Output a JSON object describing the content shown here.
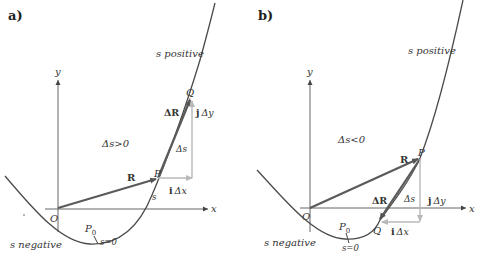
{
  "colors": {
    "curve": "#4a4a4a",
    "axis": "#555555",
    "vector": "#5a5a5a",
    "component": "#b8b8b8",
    "text": "#333333"
  },
  "panel_a": {
    "label": "a)",
    "axis_x": "x",
    "axis_y": "y",
    "origin": "O",
    "point_P": "P",
    "point_Q": "Q",
    "point_P0": "P",
    "point_P0_sub": "0",
    "s_positive": "s positive",
    "s_negative": "s negative",
    "s_zero": "s=0",
    "delta_s_cond": "Δs>0",
    "vec_R": "R",
    "vec_dR": "ΔR",
    "arc_ds": "Δs",
    "arc_s": "s",
    "comp_i": "i",
    "comp_i_tail": "Δx",
    "comp_j": "j",
    "comp_j_tail": "Δy"
  },
  "panel_b": {
    "label": "b)",
    "axis_x": "x",
    "axis_y": "y",
    "origin": "O",
    "point_P": "P",
    "point_Q": "Q",
    "point_P0": "P",
    "point_P0_sub": "0",
    "s_positive": "s positive",
    "s_negative": "s negative",
    "s_zero": "s=0",
    "delta_s_cond": "Δs<0",
    "vec_R": "R",
    "vec_dR": "ΔR",
    "arc_ds": "Δs",
    "comp_i": "i",
    "comp_i_tail": "Δx",
    "comp_j": "j",
    "comp_j_tail": "Δy"
  }
}
